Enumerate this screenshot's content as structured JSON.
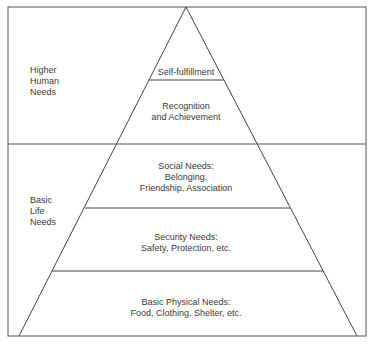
{
  "diagram": {
    "type": "pyramid",
    "side_labels": [
      {
        "lines": [
          "Higher",
          "Human",
          "Needs"
        ]
      },
      {
        "lines": [
          "Basic",
          "Life",
          "Needs"
        ]
      }
    ],
    "levels": [
      {
        "lines": [
          "Self-fulfillment"
        ]
      },
      {
        "lines": [
          "Recognition",
          "and Achievement"
        ]
      },
      {
        "lines": [
          "Social Needs:",
          "Belonging,",
          "Friendship, Association"
        ]
      },
      {
        "lines": [
          "Security Needs:",
          "Safety, Protection, etc."
        ]
      },
      {
        "lines": [
          "Basic Physical Needs:",
          "Food, Clothing, Shelter, etc."
        ]
      }
    ],
    "colors": {
      "line": "#444444",
      "background": "#ffffff",
      "text": "#3a3a3a"
    }
  }
}
